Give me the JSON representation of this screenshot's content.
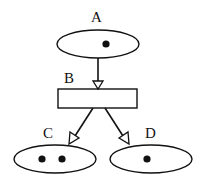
{
  "diagram": {
    "nodes": [
      {
        "id": "A",
        "label": "A",
        "shape": "ellipse",
        "dots": 1
      },
      {
        "id": "B",
        "label": "B",
        "shape": "rectangle",
        "dots": 0
      },
      {
        "id": "C",
        "label": "C",
        "shape": "ellipse",
        "dots": 2
      },
      {
        "id": "D",
        "label": "D",
        "shape": "ellipse",
        "dots": 1
      }
    ],
    "edges": [
      {
        "from": "A",
        "to": "B",
        "arrowhead": "hollow-triangle"
      },
      {
        "from": "B",
        "to": "C",
        "arrowhead": "hollow-triangle"
      },
      {
        "from": "B",
        "to": "D",
        "arrowhead": "hollow-triangle"
      }
    ],
    "colors": {
      "stroke": "#111111",
      "background": "#ffffff"
    }
  }
}
